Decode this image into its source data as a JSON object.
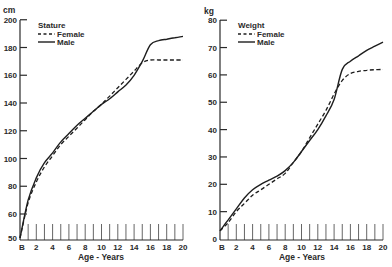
{
  "chart_data": [
    {
      "type": "line",
      "title": "Stature",
      "xlabel": "Age - Years",
      "ylabel": "cm",
      "x_tick_labels": [
        "B",
        "2",
        "4",
        "6",
        "8",
        "10",
        "12",
        "14",
        "16",
        "18",
        "20"
      ],
      "y_tick_labels": [
        "50",
        "60",
        "80",
        "100",
        "120",
        "140",
        "160",
        "180",
        "200"
      ],
      "ylim": [
        50,
        200
      ],
      "xlim": [
        0,
        20
      ],
      "grid": false,
      "legend_position": "upper-left",
      "x": [
        0,
        1,
        2,
        3,
        4,
        5,
        6,
        7,
        8,
        9,
        10,
        11,
        12,
        13,
        14,
        15,
        16,
        17,
        18,
        19,
        20
      ],
      "series": [
        {
          "name": "Female",
          "style": "dashed",
          "values": [
            50,
            68,
            83,
            94,
            102,
            110,
            116,
            122,
            128,
            134,
            139,
            145,
            151,
            157,
            163,
            169,
            171,
            171,
            171,
            171,
            171
          ]
        },
        {
          "name": "Male",
          "style": "solid",
          "values": [
            50,
            70,
            86,
            97,
            104,
            112,
            118,
            124,
            129,
            134,
            139,
            143,
            148,
            153,
            160,
            170,
            182,
            185,
            186,
            187,
            188
          ]
        }
      ]
    },
    {
      "type": "line",
      "title": "Weight",
      "xlabel": "Age - Years",
      "ylabel": "kg",
      "x_tick_labels": [
        "B",
        "2",
        "4",
        "6",
        "8",
        "10",
        "12",
        "14",
        "16",
        "18",
        "20"
      ],
      "y_tick_labels": [
        "0",
        "10",
        "20",
        "30",
        "40",
        "50",
        "60",
        "70",
        "80"
      ],
      "ylim": [
        0,
        80
      ],
      "xlim": [
        0,
        20
      ],
      "grid": false,
      "legend_position": "upper-left",
      "x": [
        0,
        1,
        2,
        3,
        4,
        5,
        6,
        7,
        8,
        9,
        10,
        11,
        12,
        13,
        14,
        15,
        16,
        17,
        18,
        19,
        20
      ],
      "series": [
        {
          "name": "Female",
          "style": "dashed",
          "values": [
            3,
            6,
            10,
            13,
            16,
            18,
            20,
            22,
            24,
            28,
            32,
            37,
            42,
            47,
            53,
            58,
            60.5,
            61.3,
            61.7,
            61.9,
            62
          ]
        },
        {
          "name": "Male",
          "style": "solid",
          "values": [
            3,
            7,
            11,
            15,
            18,
            20,
            21.5,
            23,
            25,
            28,
            32,
            36,
            40,
            45,
            51,
            62,
            65,
            67,
            69,
            70.5,
            72
          ]
        }
      ]
    }
  ],
  "charts": [
    {
      "unit": "cm",
      "legend_title": "Stature",
      "legend_female": "Female",
      "legend_male": "Male",
      "xlabel": "Age - Years"
    },
    {
      "unit": "kg",
      "legend_title": "Weight",
      "legend_female": "Female",
      "legend_male": "Male",
      "xlabel": "Age - Years"
    }
  ]
}
